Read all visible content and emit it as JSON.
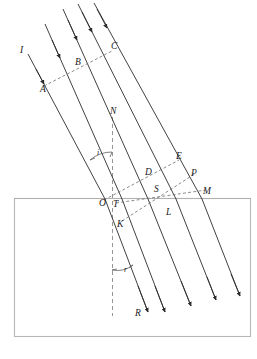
{
  "figure": {
    "domain_type": "diagram",
    "width": 257,
    "height": 359,
    "colors": {
      "ray": "#2b2b2b",
      "wavefront": "#6d6d6d",
      "normal": "#8a8a8a",
      "medium_box": "#b6b6b6",
      "background": "#ffffff"
    }
  },
  "labels": {
    "incident_ray": "I",
    "wavefront_point_a": "A",
    "wavefront_point_b": "B",
    "wavefront_point_c": "C",
    "normal": "N",
    "angle_incidence": "i",
    "point_d": "D",
    "point_e": "E",
    "point_p": "P",
    "point_o": "O",
    "point_t": "T",
    "point_s": "S",
    "point_m": "M",
    "point_k": "K",
    "point_l": "L",
    "angle_refraction": "r",
    "refracted_ray": "R"
  },
  "elements": {
    "incident_rays_count": 5,
    "refracted_rays_count": 5,
    "wavefronts_incident": [
      "A-B-C",
      "O-D-E"
    ],
    "wavefronts_refracted": [
      "T-S-M",
      "K-L-P"
    ],
    "normal_line": "vertical dashed line through O",
    "medium_boundary": "horizontal surface at y=198",
    "denser_medium": "rectangle below surface"
  }
}
